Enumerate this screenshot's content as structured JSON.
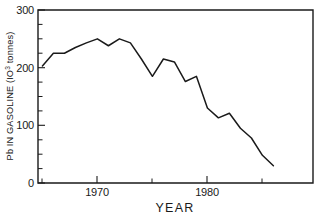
{
  "chart_data": {
    "type": "line",
    "title": "",
    "xlabel": "YEAR",
    "ylabel": "Pb IN GASOLINE (10^3 tonnes)",
    "ylabel_parts": {
      "prefix": "Pb IN GASOLINE  (IO",
      "exponent": "3",
      "suffix": " tonnes)"
    },
    "xlim": [
      1964.6,
      1989.6
    ],
    "ylim": [
      0,
      300
    ],
    "grid": false,
    "legend": null,
    "y_ticks_labeled": [
      0,
      100,
      200,
      300
    ],
    "y_tick_labels": [
      "0",
      "100",
      "200",
      "300"
    ],
    "y_ticks_minor": [
      25,
      50,
      75,
      125,
      150,
      175,
      225,
      250,
      275
    ],
    "x_ticks_labeled": [
      1970,
      1980
    ],
    "x_tick_labels": [
      "1970",
      "1980"
    ],
    "x_ticks_minor": [
      1965,
      1975,
      1985
    ],
    "series": [
      {
        "name": "Pb in gasoline",
        "x": [
          1965,
          1966,
          1967,
          1968,
          1969,
          1970,
          1971,
          1972,
          1973,
          1974,
          1975,
          1976,
          1977,
          1978,
          1979,
          1980,
          1981,
          1982,
          1983,
          1984,
          1985,
          1986
        ],
        "values": [
          203,
          225,
          225,
          235,
          243,
          250,
          238,
          250,
          243,
          215,
          185,
          215,
          210,
          176,
          185,
          130,
          113,
          121,
          95,
          78,
          48,
          30
        ]
      }
    ],
    "colors": {
      "line": "#1a1a1a",
      "axis": "#1a1a1a",
      "background": "#ffffff"
    }
  },
  "figure": {
    "plot_area": {
      "left": 38,
      "right": 313,
      "top": 10,
      "bottom": 183
    }
  }
}
